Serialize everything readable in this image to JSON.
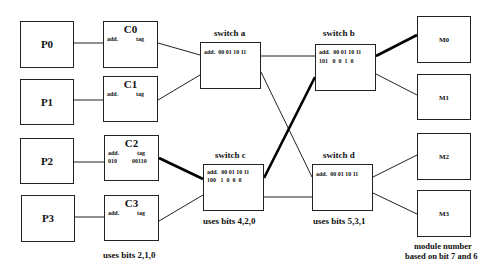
{
  "processors": [
    {
      "label": "P0"
    },
    {
      "label": "P1"
    },
    {
      "label": "P2"
    },
    {
      "label": "P3"
    }
  ],
  "caches": [
    {
      "label": "C0",
      "add_label": "add.",
      "tag_label": "tag",
      "add_value": "",
      "tag_value": ""
    },
    {
      "label": "C1",
      "add_label": "add.",
      "tag_label": "tag",
      "add_value": "",
      "tag_value": ""
    },
    {
      "label": "C2",
      "add_label": "add.",
      "tag_label": "tag",
      "add_value": "010",
      "tag_value": "00110"
    },
    {
      "label": "C3",
      "add_label": "add.",
      "tag_label": "tag",
      "add_value": "",
      "tag_value": ""
    }
  ],
  "cache_caption": "uses bits 2,1,0",
  "switches": {
    "a": {
      "title": "switch a",
      "header": "add.  00 01 10 11",
      "row": ""
    },
    "b": {
      "title": "switch b",
      "header": "add.  00 01 10 11",
      "row": "101   0  0  1  0"
    },
    "c": {
      "title": "switch c",
      "header": "add.  00 01 10 11",
      "row": "100   1  0  0  0",
      "caption": "uses bits 4,2,0"
    },
    "d": {
      "title": "switch d",
      "header": "add.  00 01 10 11",
      "row": "",
      "caption": "uses bits 5,3,1"
    }
  },
  "modules": [
    {
      "label": "M0"
    },
    {
      "label": "M1"
    },
    {
      "label": "M2"
    },
    {
      "label": "M3"
    }
  ],
  "module_caption": {
    "line1": "module number",
    "line2": "based on bit 7 and 6"
  },
  "colors": {
    "line": "#222222",
    "highlight": "#000000",
    "background": "#ffffff"
  }
}
